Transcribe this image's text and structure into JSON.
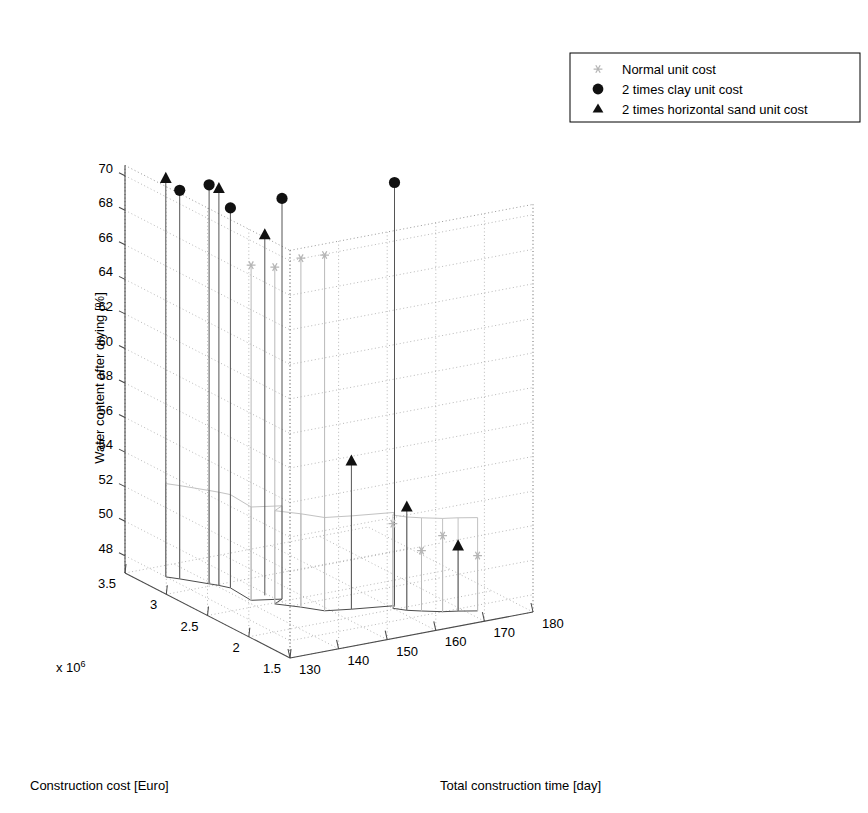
{
  "figure": {
    "background": "#ffffff",
    "type": "3d-stem-plot"
  },
  "legend": {
    "position": "top-right",
    "entries": [
      {
        "marker": "asterisk-marker",
        "label": "Normal unit cost",
        "color": "#777777"
      },
      {
        "marker": "circle-marker",
        "label": "2 times clay unit cost",
        "color": "#111111"
      },
      {
        "marker": "triangle-marker",
        "label": "2 times horizontal sand unit cost",
        "color": "#111111"
      }
    ]
  },
  "chart_data": {
    "type": "scatter",
    "title": "",
    "xlabel": "Construction cost [Euro]",
    "ylabel": "Total construction time [day]",
    "zlabel": "Water content after drying [%]",
    "x_exponent_label": "x 10",
    "x_exponent_sup": "6",
    "xticks": [
      1.5,
      2,
      2.5,
      3,
      3.5
    ],
    "xticklabels": [
      "1.5",
      "2",
      "2.5",
      "3",
      "3.5"
    ],
    "yticks": [
      130,
      140,
      150,
      160,
      170,
      180
    ],
    "yticklabels": [
      "130",
      "140",
      "150",
      "160",
      "170",
      "180"
    ],
    "zticks": [
      48,
      50,
      52,
      54,
      56,
      58,
      60,
      62,
      64,
      66,
      68,
      70
    ],
    "zticklabels": [
      "48",
      "50",
      "52",
      "54",
      "56",
      "58",
      "60",
      "62",
      "64",
      "66",
      "68",
      "70"
    ],
    "xlim": [
      1.5,
      3.5
    ],
    "ylim": [
      130,
      180
    ],
    "zlim": [
      47.0,
      70.6
    ],
    "grid": true,
    "legend_position": "upper right",
    "series": [
      {
        "name": "Normal unit cost",
        "marker": "asterisk",
        "points": [
          {
            "x": 2.62,
            "y": 141.0,
            "z": 66.4
          },
          {
            "x": 2.48,
            "y": 143.5,
            "z": 66.5
          },
          {
            "x": 2.34,
            "y": 146.5,
            "z": 67.2
          },
          {
            "x": 2.2,
            "y": 149.0,
            "z": 67.6
          },
          {
            "x": 2.02,
            "y": 160.0,
            "z": 51.9
          },
          {
            "x": 1.88,
            "y": 163.5,
            "z": 50.5
          },
          {
            "x": 1.8,
            "y": 166.5,
            "z": 51.4
          },
          {
            "x": 1.7,
            "y": 172.0,
            "z": 50.2
          }
        ]
      },
      {
        "name": "2 times clay unit cost",
        "marker": "circle",
        "points": [
          {
            "x": 3.22,
            "y": 136.5,
            "z": 69.5
          },
          {
            "x": 3.04,
            "y": 139.5,
            "z": 70.1
          },
          {
            "x": 2.9,
            "y": 141.5,
            "z": 69.0
          },
          {
            "x": 2.54,
            "y": 146.0,
            "z": 70.2
          },
          {
            "x": 2.06,
            "y": 161.0,
            "z": 71.5
          }
        ]
      },
      {
        "name": "2 times horizontal sand unit cost",
        "marker": "triangle",
        "points": [
          {
            "x": 3.3,
            "y": 135.0,
            "z": 70.1
          },
          {
            "x": 2.98,
            "y": 140.5,
            "z": 70.0
          },
          {
            "x": 2.66,
            "y": 144.5,
            "z": 67.9
          },
          {
            "x": 2.14,
            "y": 153.5,
            "z": 55.6
          },
          {
            "x": 1.94,
            "y": 161.5,
            "z": 53.0
          },
          {
            "x": 1.76,
            "y": 169.0,
            "z": 50.8
          }
        ]
      }
    ],
    "baseline_z": 47.0,
    "ribbon": {
      "description": "curtain surface connecting stem bases",
      "path": [
        {
          "x": 3.3,
          "y": 135.0
        },
        {
          "x": 3.22,
          "y": 136.5
        },
        {
          "x": 3.04,
          "y": 139.5
        },
        {
          "x": 2.98,
          "y": 140.5
        },
        {
          "x": 2.9,
          "y": 141.5
        },
        {
          "x": 2.62,
          "y": 141.0
        },
        {
          "x": 2.54,
          "y": 146.0
        },
        {
          "x": 2.48,
          "y": 143.5
        },
        {
          "x": 2.34,
          "y": 146.5
        },
        {
          "x": 2.2,
          "y": 149.0
        },
        {
          "x": 2.14,
          "y": 153.5
        },
        {
          "x": 2.06,
          "y": 161.0
        },
        {
          "x": 2.02,
          "y": 160.0
        },
        {
          "x": 1.94,
          "y": 161.5
        },
        {
          "x": 1.88,
          "y": 163.5
        },
        {
          "x": 1.8,
          "y": 166.5
        },
        {
          "x": 1.76,
          "y": 169.0
        },
        {
          "x": 1.7,
          "y": 172.0
        }
      ]
    }
  }
}
